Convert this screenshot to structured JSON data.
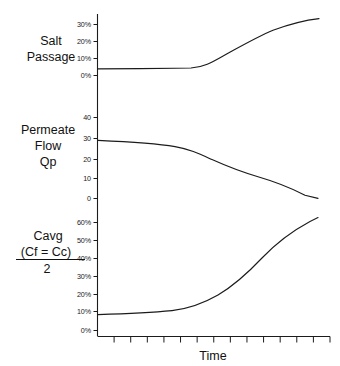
{
  "figure": {
    "title": "",
    "x_axis_title": "Time",
    "panels": [
      {
        "id": "salt-passage",
        "label_lines": [
          "Salt",
          "Passage"
        ],
        "y_ticks": [
          "0%",
          "10%",
          "20%",
          "30%"
        ],
        "y_tick_values": [
          0,
          10,
          20,
          30
        ]
      },
      {
        "id": "permeate-flow",
        "label_lines": [
          "Permeate",
          "Flow",
          "Qp"
        ],
        "y_ticks": [
          "0",
          "10",
          "20",
          "30",
          "40"
        ],
        "y_tick_values": [
          0,
          10,
          20,
          30,
          40
        ]
      },
      {
        "id": "cavg",
        "label_lines": [
          "Cavg",
          "(Cf = Cc)",
          "2"
        ],
        "y_ticks": [
          "0%",
          "10%",
          "20%",
          "30%",
          "40%",
          "50%",
          "60%"
        ],
        "y_tick_values": [
          0,
          10,
          20,
          30,
          40,
          50,
          60
        ]
      }
    ]
  },
  "chart_data": [
    {
      "type": "line",
      "title": "Salt Passage",
      "xlabel": "Time",
      "ylabel": "Salt Passage",
      "ylim": [
        0,
        35
      ],
      "ytick_labels": [
        "0%",
        "10%",
        "20%",
        "30%"
      ],
      "yticks": [
        0,
        10,
        20,
        30
      ],
      "grid": false,
      "legend": "none",
      "x": [
        0,
        10,
        20,
        30,
        40,
        50,
        55,
        60,
        65,
        70,
        75,
        80,
        85,
        90,
        95,
        100
      ],
      "values": [
        4,
        4,
        4.1,
        4.2,
        4.3,
        4.5,
        4.8,
        6.2,
        8.5,
        11.5,
        14.5,
        17.8,
        21,
        24.2,
        27.5,
        31
      ],
      "series": [
        {
          "name": "Salt Passage",
          "values": [
            4,
            4,
            4.1,
            4.2,
            4.3,
            4.5,
            4.8,
            6.2,
            8.5,
            11.5,
            14.5,
            17.8,
            21,
            24.2,
            27.5,
            31
          ]
        }
      ]
    },
    {
      "type": "line",
      "title": "Permeate Flow Qp",
      "xlabel": "Time",
      "ylabel": "Permeate Flow Qp",
      "ylim": [
        0,
        45
      ],
      "ytick_labels": [
        "0",
        "10",
        "20",
        "30",
        "40"
      ],
      "yticks": [
        0,
        10,
        20,
        30,
        40
      ],
      "grid": false,
      "legend": "none",
      "x": [
        0,
        10,
        20,
        30,
        40,
        50,
        55,
        60,
        65,
        70,
        75,
        80,
        85,
        90,
        95,
        100
      ],
      "values": [
        29,
        28.6,
        28.1,
        27.5,
        26.8,
        26,
        25.4,
        23.8,
        21.8,
        19.6,
        17.4,
        15.2,
        13.2,
        10.6,
        6.4,
        1.2
      ],
      "series": [
        {
          "name": "Permeate Flow Qp",
          "values": [
            29,
            28.6,
            28.1,
            27.5,
            26.8,
            26,
            25.4,
            23.8,
            21.8,
            19.6,
            17.4,
            15.2,
            13.2,
            10.6,
            6.4,
            1.2
          ]
        }
      ]
    },
    {
      "type": "line",
      "title": "Cavg (Cf = Cc) / 2",
      "xlabel": "Time",
      "ylabel": "Cavg (Cf = Cc) / 2",
      "ylim": [
        0,
        65
      ],
      "ytick_labels": [
        "0%",
        "10%",
        "20%",
        "30%",
        "40%",
        "50%",
        "60%"
      ],
      "yticks": [
        0,
        10,
        20,
        30,
        40,
        50,
        60
      ],
      "grid": false,
      "legend": "none",
      "x": [
        0,
        10,
        20,
        30,
        40,
        50,
        55,
        60,
        65,
        70,
        75,
        80,
        85,
        90,
        95,
        100
      ],
      "values": [
        9.2,
        9.6,
        10.1,
        10.8,
        11.8,
        13.2,
        14.4,
        16.4,
        19,
        22.2,
        26,
        30.4,
        35.6,
        42,
        50,
        60
      ],
      "series": [
        {
          "name": "Cavg",
          "values": [
            9.2,
            9.6,
            10.1,
            10.8,
            11.8,
            13.2,
            14.4,
            16.4,
            19,
            22.2,
            26,
            30.4,
            35.6,
            42,
            50,
            60
          ]
        }
      ]
    }
  ],
  "x_axis": {
    "title": "Time",
    "tick_count": 14,
    "tick_labels": []
  },
  "colors": {
    "line": "#1b1b1b",
    "axis": "#1b1b1b",
    "text": "#111111",
    "background": "#ffffff"
  }
}
